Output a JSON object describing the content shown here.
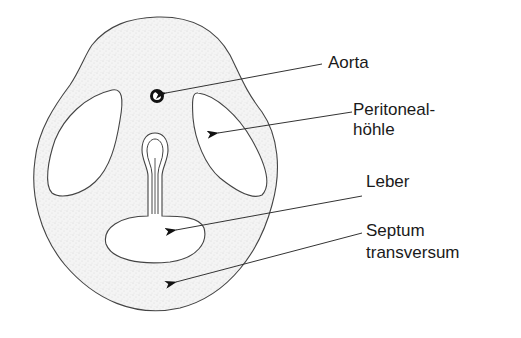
{
  "figure": {
    "type": "anatomical cross-section",
    "colors": {
      "tissue_fill": "#f2f2f2",
      "stipple": "#b8b8b8",
      "outline": "#333333",
      "cavity_fill": "#ffffff",
      "aorta": "#111111",
      "text": "#1a1a1a"
    }
  },
  "labels": {
    "aorta": "Aorta",
    "peritoneal_line1": "Peritoneal-",
    "peritoneal_line2": "höhle",
    "leber": "Leber",
    "septum_line1": "Septum",
    "septum_line2": "transversum"
  }
}
